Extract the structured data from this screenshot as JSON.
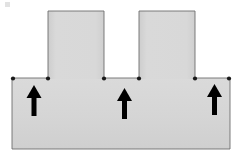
{
  "figure": {
    "type": "engineering-cross-section-diagram",
    "canvas": {
      "width": 239,
      "height": 162,
      "background": "#ffffff"
    },
    "colors": {
      "fill": "#d4d4d4",
      "fill_light": "#dcdcdc",
      "outline": "#6e6e6e",
      "vertex_dot": "#1a1a1a",
      "arrow": "#000000",
      "background": "#ffffff"
    },
    "body_outline": {
      "name": "t-section-profile",
      "points": "12,78 48,78 48,11 104,11 104,78 139,78 139,11 195,11 195,78 230,78 230,149 12,149",
      "stroke_width": 0.9
    },
    "parts": [
      {
        "name": "base-slab",
        "label": "base slab",
        "x": 12,
        "y": 78,
        "width": 218,
        "height": 71
      },
      {
        "name": "left-pillar",
        "label": "left pillar",
        "x": 48,
        "y": 11,
        "width": 56,
        "height": 67
      },
      {
        "name": "right-pillar",
        "label": "right pillar",
        "x": 139,
        "y": 11,
        "width": 56,
        "height": 67
      },
      {
        "name": "notch-gap",
        "label": "notch between pillars",
        "x": 104,
        "y": 11,
        "width": 35,
        "height": 67
      }
    ],
    "vertex_dots": [
      {
        "name": "vertex-left-outer",
        "cx": 13,
        "cy": 78.5,
        "r": 2.1
      },
      {
        "name": "vertex-left-pillar-base",
        "cx": 48,
        "cy": 78.5,
        "r": 2.1
      },
      {
        "name": "vertex-notch-left",
        "cx": 104,
        "cy": 78.5,
        "r": 2.1
      },
      {
        "name": "vertex-notch-right",
        "cx": 139,
        "cy": 78.5,
        "r": 2.1
      },
      {
        "name": "vertex-right-pillar-base",
        "cx": 195,
        "cy": 78.5,
        "r": 2.1
      },
      {
        "name": "vertex-right-outer",
        "cx": 229,
        "cy": 78.5,
        "r": 2.1
      }
    ],
    "arrows": [
      {
        "name": "reaction-arrow-left",
        "label": "upward reaction (left)",
        "direction": "up",
        "x": 34,
        "y_tail": 116,
        "y_head": 85,
        "shaft_width": 5,
        "head_width": 15,
        "head_height": 13
      },
      {
        "name": "reaction-arrow-center",
        "label": "upward reaction (center)",
        "direction": "up",
        "x": 124.5,
        "y_tail": 119,
        "y_head": 88,
        "shaft_width": 5,
        "head_width": 15,
        "head_height": 13
      },
      {
        "name": "reaction-arrow-right",
        "label": "upward reaction (right)",
        "direction": "up",
        "x": 214.5,
        "y_tail": 115,
        "y_head": 84,
        "shaft_width": 5,
        "head_width": 15,
        "head_height": 13
      }
    ],
    "corner_mark": {
      "name": "scan-artifact-mark",
      "x": 5,
      "y": 2,
      "width": 5,
      "height": 5,
      "color": "#e2e2e2"
    }
  }
}
